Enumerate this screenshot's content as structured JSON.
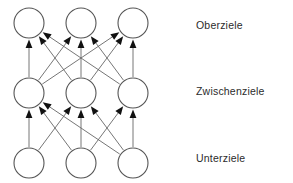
{
  "diagram": {
    "type": "hierarchical-goal-network",
    "background_color": "#ffffff",
    "node_stroke_color": "#555555",
    "node_fill_color": "#ffffff",
    "edge_color": "#666666",
    "arrow_color": "#111111",
    "label_color": "#2b2b2b",
    "layers": [
      {
        "id": "oberziele",
        "label": "Oberziele",
        "label_x": 196,
        "label_y": 19,
        "cy": 23,
        "nodes": [
          {
            "id": "o1",
            "cx": 29,
            "cy": 23,
            "r": 15,
            "label": ""
          },
          {
            "id": "o2",
            "cx": 81,
            "cy": 23,
            "r": 15,
            "label": ""
          },
          {
            "id": "o3",
            "cx": 133,
            "cy": 23,
            "r": 15,
            "label": ""
          }
        ]
      },
      {
        "id": "zwischenziele",
        "label": "Zwischenziele",
        "label_x": 196,
        "label_y": 85,
        "cy": 93,
        "nodes": [
          {
            "id": "z1",
            "cx": 29,
            "cy": 93,
            "r": 15,
            "label": ""
          },
          {
            "id": "z2",
            "cx": 81,
            "cy": 93,
            "r": 15,
            "label": ""
          },
          {
            "id": "z3",
            "cx": 133,
            "cy": 93,
            "r": 15,
            "label": ""
          }
        ]
      },
      {
        "id": "unterziele",
        "label": "Unterziele",
        "label_x": 196,
        "label_y": 152,
        "cy": 163,
        "nodes": [
          {
            "id": "u1",
            "cx": 29,
            "cy": 163,
            "r": 15,
            "label": ""
          },
          {
            "id": "u2",
            "cx": 81,
            "cy": 163,
            "r": 15,
            "label": ""
          },
          {
            "id": "u3",
            "cx": 133,
            "cy": 163,
            "r": 15,
            "label": ""
          }
        ]
      }
    ],
    "edges": [
      {
        "from": "z1",
        "to": "o1"
      },
      {
        "from": "z2",
        "to": "o1"
      },
      {
        "from": "z3",
        "to": "o1"
      },
      {
        "from": "z1",
        "to": "o2"
      },
      {
        "from": "z2",
        "to": "o2"
      },
      {
        "from": "z3",
        "to": "o2"
      },
      {
        "from": "z1",
        "to": "o3"
      },
      {
        "from": "z2",
        "to": "o3"
      },
      {
        "from": "z3",
        "to": "o3"
      },
      {
        "from": "u1",
        "to": "z1"
      },
      {
        "from": "u2",
        "to": "z1"
      },
      {
        "from": "u3",
        "to": "z1"
      },
      {
        "from": "u1",
        "to": "z2"
      },
      {
        "from": "u2",
        "to": "z2"
      },
      {
        "from": "u3",
        "to": "z2"
      },
      {
        "from": "u2",
        "to": "z3"
      },
      {
        "from": "u3",
        "to": "z3"
      }
    ],
    "edge_count": 17,
    "node_count": 9
  }
}
